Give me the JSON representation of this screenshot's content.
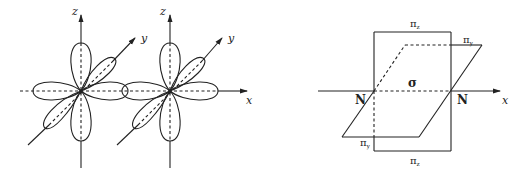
{
  "figure": {
    "left_panel": {
      "description": "Two nitrogen atoms with p orbitals (px, py, pz lobes) along x axis",
      "axes_labels": {
        "z1": "z",
        "y1": "y",
        "z2": "z",
        "y2": "y",
        "x": "x"
      }
    },
    "right_panel": {
      "description": "Bonding in N2: sigma bond along x axis and two pi bonds in perpendicular planes",
      "labels": {
        "pi_z_top": "π",
        "pi_z_top_sub": "z",
        "pi_y_top": "π",
        "pi_y_top_sub": "y",
        "sigma": "σ",
        "n_left": "N",
        "n_right": "N",
        "x": "x",
        "pi_y_bottom": "π",
        "pi_y_bottom_sub": "y",
        "pi_z_bottom": "π",
        "pi_z_bottom_sub": "z"
      }
    }
  }
}
